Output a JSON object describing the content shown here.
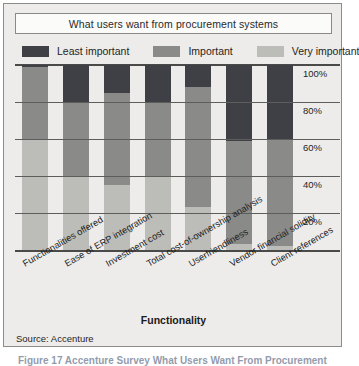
{
  "figure": {
    "title": "What users want from procurement systems",
    "axis_title": "Functionality",
    "source": "Source: Accenture",
    "caption": "Figure 17  Accenture Survey  What Users Want From Procurement"
  },
  "colors": {
    "least_important": "#3f4045",
    "important": "#8a8a88",
    "very_important": "#bcbcb8",
    "panel_background": "#edecea",
    "panel_border": "#8d8c88",
    "grid": "#5d5d5b",
    "text": "#1f1f1f"
  },
  "chart_data": {
    "type": "bar",
    "subtype": "stacked-100-percent",
    "title": "What users want from procurement systems",
    "xlabel": "Functionality",
    "ylabel": "",
    "ylim": [
      0,
      100
    ],
    "yticks": [
      "20%",
      "40%",
      "60%",
      "80%",
      "100%"
    ],
    "ytick_values": [
      20,
      40,
      60,
      80,
      100
    ],
    "grid": true,
    "legend_position": "top",
    "categories": [
      "Functionalities offered",
      "Ease of ERP integration",
      "Investment cost",
      "Total cost-of-ownership analysis",
      "Userfriendliness",
      "Vendor financial solidity",
      "Client references"
    ],
    "series": [
      {
        "name": "Least important",
        "color": "#3f4045",
        "values": [
          1,
          20,
          15,
          20,
          12,
          41,
          40
        ]
      },
      {
        "name": "Important",
        "color": "#8a8a88",
        "values": [
          39,
          40,
          50,
          40,
          65,
          56,
          58
        ]
      },
      {
        "name": "Very important",
        "color": "#bcbcb8",
        "values": [
          60,
          40,
          35,
          40,
          23,
          3,
          2
        ]
      }
    ]
  }
}
